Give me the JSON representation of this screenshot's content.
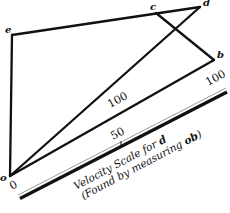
{
  "diagram": {
    "points": {
      "o": {
        "label": "o",
        "x": 10,
        "y": 176
      },
      "e": {
        "label": "e",
        "x": 12,
        "y": 35
      },
      "c": {
        "label": "c",
        "x": 156,
        "y": 13
      },
      "d": {
        "label": "d",
        "x": 200,
        "y": 7
      },
      "b": {
        "label": "b",
        "x": 214,
        "y": 60
      }
    },
    "segments": [
      [
        "o",
        "e"
      ],
      [
        "e",
        "d"
      ],
      [
        "c",
        "b"
      ],
      [
        "o",
        "b"
      ],
      [
        "o",
        "d"
      ]
    ],
    "line_label_od": "100",
    "scale": {
      "tick_0": "0",
      "tick_50": "50",
      "tick_100": "100",
      "caption_line1": "Velocity Scale for ",
      "caption_line1_bold": "d",
      "caption_line2": "(Found by measuring ",
      "caption_line2_bold": "ob",
      "caption_line2_end": ")"
    },
    "colors": {
      "ink": "#111111",
      "scale_gray": "#9a9a9a",
      "background": "#ffffff"
    }
  }
}
